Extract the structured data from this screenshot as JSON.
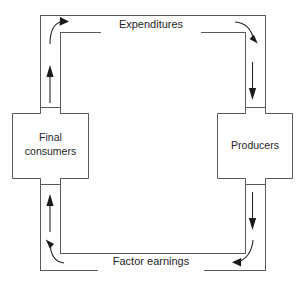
{
  "diagram": {
    "type": "circular-flow",
    "colors": {
      "channel_stroke": "#595959",
      "node_stroke": "#595959",
      "arrow": "#1a1a1a",
      "background": "#ffffff",
      "text": "#262626"
    },
    "nodes": [
      {
        "id": "final-consumers",
        "label_line_1": "Final",
        "label_line_2": "consumers",
        "position": "left"
      },
      {
        "id": "producers",
        "label_line_1": "Producers",
        "label_line_2": "",
        "position": "right"
      }
    ],
    "flows": [
      {
        "id": "expenditures",
        "label": "Expenditures",
        "position": "top",
        "direction": "left-to-right"
      },
      {
        "id": "factor-earnings",
        "label": "Factor earnings",
        "position": "bottom",
        "direction": "right-to-left"
      }
    ],
    "arrows": [
      {
        "id": "arrow-top-left-corner",
        "shape": "curved",
        "points": "up-right"
      },
      {
        "id": "arrow-top-right-corner",
        "shape": "curved",
        "points": "down"
      },
      {
        "id": "arrow-bottom-right-corner",
        "shape": "curved",
        "points": "left"
      },
      {
        "id": "arrow-bottom-left-corner",
        "shape": "curved",
        "points": "up-left"
      },
      {
        "id": "arrow-left-upper",
        "shape": "straight",
        "points": "up"
      },
      {
        "id": "arrow-left-lower",
        "shape": "straight",
        "points": "up"
      },
      {
        "id": "arrow-right-upper",
        "shape": "straight",
        "points": "down"
      },
      {
        "id": "arrow-right-lower",
        "shape": "straight",
        "points": "down"
      }
    ]
  }
}
